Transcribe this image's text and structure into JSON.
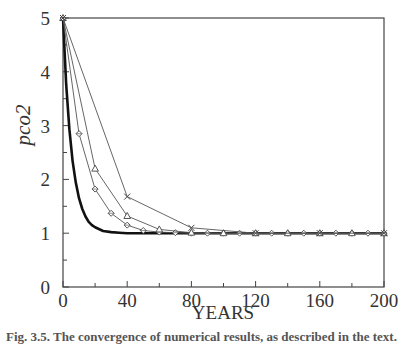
{
  "chart_data": {
    "type": "line",
    "title": "",
    "xlabel": "YEARS",
    "ylabel": "pco2",
    "xlim": [
      0,
      200
    ],
    "ylim": [
      0,
      5
    ],
    "x_ticks": [
      0,
      40,
      80,
      120,
      160,
      200
    ],
    "x_minor_ticks": [
      20,
      60,
      100,
      140,
      180
    ],
    "y_ticks": [
      0,
      1,
      2,
      3,
      4,
      5
    ],
    "y_minor_ticks": [
      0.5,
      1.5,
      2.5,
      3.5,
      4.5
    ],
    "grid": false,
    "legend": null,
    "series": [
      {
        "name": "exact solution",
        "style": "thick-solid",
        "marker": "none",
        "x": [
          0,
          2,
          4,
          6,
          8,
          10,
          12,
          14,
          16,
          18,
          20,
          25,
          30,
          35,
          40,
          50,
          60,
          80,
          100,
          120,
          140,
          160,
          180,
          200
        ],
        "values": [
          5.0,
          3.76,
          2.93,
          2.34,
          1.94,
          1.65,
          1.45,
          1.31,
          1.21,
          1.15,
          1.11,
          1.04,
          1.02,
          1.01,
          1.0,
          1.0,
          1.0,
          1.0,
          1.0,
          1.0,
          1.0,
          1.0,
          1.0,
          1.0
        ]
      },
      {
        "name": "step 10",
        "style": "thin-solid",
        "marker": "diamond",
        "x": [
          0,
          10,
          20,
          30,
          40,
          50,
          60,
          70,
          80,
          90,
          100,
          110,
          120,
          130,
          140,
          150,
          160,
          170,
          180,
          190,
          200
        ],
        "values": [
          5.0,
          2.85,
          1.82,
          1.37,
          1.15,
          1.05,
          1.02,
          1.01,
          1.0,
          1.0,
          1.0,
          1.0,
          1.0,
          1.0,
          1.0,
          1.0,
          1.0,
          1.0,
          1.0,
          1.0,
          1.0
        ]
      },
      {
        "name": "step 20",
        "style": "thin-solid",
        "marker": "triangle",
        "x": [
          0,
          20,
          40,
          60,
          80,
          100,
          120,
          140,
          160,
          180,
          200
        ],
        "values": [
          5.0,
          2.2,
          1.32,
          1.07,
          1.01,
          1.0,
          1.0,
          1.0,
          1.0,
          1.0,
          1.0
        ]
      },
      {
        "name": "step 40",
        "style": "thin-solid",
        "marker": "x",
        "x": [
          0,
          40,
          80,
          120,
          160,
          200
        ],
        "values": [
          5.0,
          1.68,
          1.1,
          1.0,
          1.0,
          1.0
        ]
      }
    ]
  },
  "axes": {
    "x_tick_labels": [
      "0",
      "40",
      "80",
      "120",
      "160",
      "200"
    ],
    "y_tick_labels": [
      "0",
      "1",
      "2",
      "3",
      "4",
      "5"
    ],
    "xlabel": "YEARS",
    "ylabel": "pco2"
  },
  "caption": "Fig. 3.5.  The convergence of numerical results, as described in the text."
}
